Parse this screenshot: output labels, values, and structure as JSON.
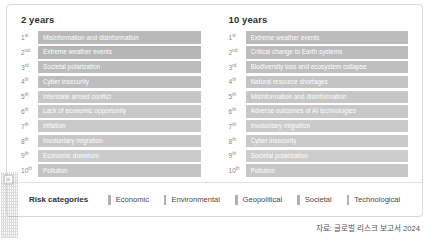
{
  "card": {
    "columns": [
      {
        "title": "2 years",
        "rows": [
          {
            "rank": "1",
            "ordinal": "st",
            "label": "Misinformation and disinformation",
            "category": "Technological",
            "color": "#b9b9b9"
          },
          {
            "rank": "2",
            "ordinal": "nd",
            "label": "Extreme weather events",
            "category": "Environmental",
            "color": "#b6b6b6"
          },
          {
            "rank": "3",
            "ordinal": "rd",
            "label": "Societal polarization",
            "category": "Societal",
            "color": "#bcbcbc"
          },
          {
            "rank": "4",
            "ordinal": "th",
            "label": "Cyber insecurity",
            "category": "Technological",
            "color": "#bdbdbd"
          },
          {
            "rank": "5",
            "ordinal": "th",
            "label": "Interstate armed conflict",
            "category": "Geopolitical",
            "color": "#c6c6c6"
          },
          {
            "rank": "6",
            "ordinal": "th",
            "label": "Lack of economic opportunity",
            "category": "Economic",
            "color": "#c8c8c8"
          },
          {
            "rank": "7",
            "ordinal": "th",
            "label": "Inflation",
            "category": "Economic",
            "color": "#c9c9c9"
          },
          {
            "rank": "8",
            "ordinal": "th",
            "label": "Involuntary migration",
            "category": "Societal",
            "color": "#c7c7c7"
          },
          {
            "rank": "9",
            "ordinal": "th",
            "label": "Economic downturn",
            "category": "Economic",
            "color": "#cbcbcb"
          },
          {
            "rank": "10",
            "ordinal": "th",
            "label": "Pollution",
            "category": "Environmental",
            "color": "#c4c4c4"
          }
        ]
      },
      {
        "title": "10 years",
        "rows": [
          {
            "rank": "1",
            "ordinal": "st",
            "label": "Extreme weather events",
            "category": "Environmental",
            "color": "#bcbcbc"
          },
          {
            "rank": "2",
            "ordinal": "nd",
            "label": "Critical change to Earth systems",
            "category": "Environmental",
            "color": "#bcbcbc"
          },
          {
            "rank": "3",
            "ordinal": "rd",
            "label": "Biodiversity loss and ecosystem collapse",
            "category": "Environmental",
            "color": "#bfbfbf"
          },
          {
            "rank": "4",
            "ordinal": "th",
            "label": "Natural resource shortages",
            "category": "Environmental",
            "color": "#c4c4c4"
          },
          {
            "rank": "5",
            "ordinal": "th",
            "label": "Misinformation and disinformation",
            "category": "Technological",
            "color": "#c6c6c6"
          },
          {
            "rank": "6",
            "ordinal": "th",
            "label": "Adverse outcomes of AI technologies",
            "category": "Technological",
            "color": "#c8c8c8"
          },
          {
            "rank": "7",
            "ordinal": "th",
            "label": "Involuntary migration",
            "category": "Societal",
            "color": "#cacaca"
          },
          {
            "rank": "8",
            "ordinal": "th",
            "label": "Cyber insecurity",
            "category": "Technological",
            "color": "#c9c9c9"
          },
          {
            "rank": "9",
            "ordinal": "th",
            "label": "Societal polarization",
            "category": "Societal",
            "color": "#cccccc"
          },
          {
            "rank": "10",
            "ordinal": "th",
            "label": "Pollution",
            "category": "Environmental",
            "color": "#c7c7c7"
          }
        ]
      }
    ],
    "legend": {
      "title": "Risk categories",
      "items": [
        {
          "label": "Economic",
          "color": "#b0b0b0"
        },
        {
          "label": "Environmental",
          "color": "#b0b0b0"
        },
        {
          "label": "Geopolitical",
          "color": "#b0b0b0"
        },
        {
          "label": "Societal",
          "color": "#b0b0b0"
        },
        {
          "label": "Technological",
          "color": "#b0b0b0"
        }
      ]
    }
  },
  "source_note": "자료: 글로벌 리스크 보고서 2024"
}
